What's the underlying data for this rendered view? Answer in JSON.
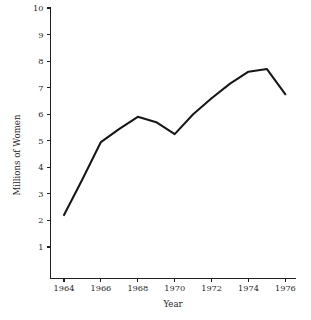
{
  "chart_data": {
    "type": "line",
    "title": "",
    "xlabel": "Year",
    "ylabel": "Millions of Women",
    "x": [
      1964,
      1965,
      1966,
      1967,
      1968,
      1969,
      1970,
      1971,
      1972,
      1973,
      1974,
      1975,
      1976
    ],
    "values": [
      2.2,
      3.55,
      4.95,
      5.45,
      5.9,
      5.7,
      5.25,
      6.0,
      6.6,
      7.15,
      7.6,
      7.7,
      6.75
    ],
    "series": [
      {
        "name": "Millions of Women",
        "values": [
          2.2,
          3.55,
          4.95,
          5.45,
          5.9,
          5.7,
          5.25,
          6.0,
          6.6,
          7.15,
          7.6,
          7.7,
          6.75
        ]
      }
    ],
    "xlim": [
      1963.0,
      1976.6
    ],
    "ylim": [
      0,
      10
    ],
    "x_tick_labels": [
      "1964",
      "1966",
      "1968",
      "1970",
      "1972",
      "1974",
      "1976"
    ],
    "x_tick_values": [
      1964,
      1966,
      1968,
      1970,
      1972,
      1974,
      1976
    ],
    "y_tick_labels": [
      "1",
      "2",
      "3",
      "4",
      "5",
      "6",
      "7",
      "8",
      "9",
      "10"
    ],
    "y_tick_values": [
      1,
      2,
      3,
      4,
      5,
      6,
      7,
      8,
      9,
      10
    ],
    "grid": false,
    "legend": "none",
    "line_color": "#161616",
    "background_color": "#ffffff",
    "axis_color": "#1f1f1f"
  },
  "axes": {
    "y_label": "Millions of Women",
    "x_label": "Year"
  }
}
